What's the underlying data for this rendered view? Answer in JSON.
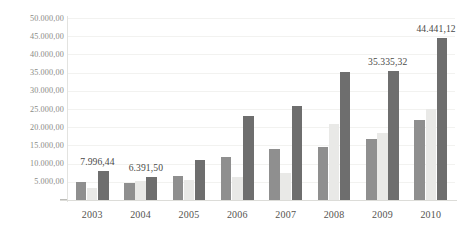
{
  "chart_data": {
    "type": "bar",
    "title": "",
    "subtitle": "",
    "xlabel": "",
    "ylabel": "",
    "categories": [
      "2003",
      "2004",
      "2005",
      "2006",
      "2007",
      "2008",
      "2009",
      "2010"
    ],
    "series": [
      {
        "name": "series-a",
        "color": "#8f8f8f",
        "values": [
          4900,
          4550,
          6600,
          11700,
          13900,
          14600,
          16800,
          21900
        ]
      },
      {
        "name": "series-b",
        "color": "#e9e9e7",
        "values": [
          3300,
          5100,
          5600,
          6400,
          7500,
          20800,
          18400,
          24900
        ]
      },
      {
        "name": "series-c",
        "color": "#6e6e6e",
        "values": [
          7996.44,
          6391.5,
          11000,
          23200,
          25700,
          35100,
          35335.32,
          44441.12
        ]
      }
    ],
    "ylim": [
      0,
      50000
    ],
    "ytick_labels": [
      "50.000,00",
      "45.000,00",
      "40.000,00",
      "35.000,00",
      "30.000,00",
      "25.000,00",
      "20.000,00",
      "15.000,00",
      "10.000,00",
      "5.000,00"
    ],
    "ytick_values": [
      50000,
      45000,
      40000,
      35000,
      30000,
      25000,
      20000,
      15000,
      10000,
      5000
    ],
    "grid": true,
    "legend": "none",
    "annotations": [
      {
        "text": "7.996,44",
        "category": "2003",
        "series": "series-c"
      },
      {
        "text": "6.391,50",
        "category": "2004",
        "series": "series-c"
      },
      {
        "text": "35.335,32",
        "category": "2009",
        "series": "series-c"
      },
      {
        "text": "44.441,12",
        "category": "2010",
        "series": "series-c"
      }
    ]
  }
}
